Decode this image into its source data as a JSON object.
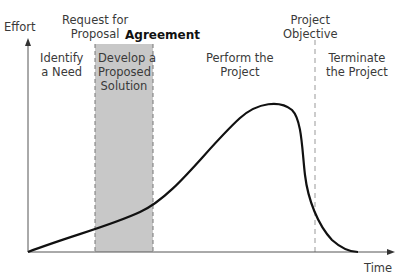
{
  "diagram": {
    "axes": {
      "y_label": "Effort",
      "x_label": "Time"
    },
    "milestones": {
      "request_for_proposal": "Request for Proposal",
      "request_line1": "Request for",
      "request_line2": "Proposal",
      "agreement": "Agreement",
      "objective_line1": "Project",
      "objective_line2": "Objective"
    },
    "phases": [
      {
        "line1": "Identify",
        "line2": "a Need",
        "line3": ""
      },
      {
        "line1": "Develop a",
        "line2": "Proposed",
        "line3": "Solution",
        "shaded": true
      },
      {
        "line1": "Perform the",
        "line2": "Project",
        "line3": ""
      },
      {
        "line1": "Terminate",
        "line2": "the Project",
        "line3": ""
      }
    ],
    "colors": {
      "shade": "#c8c8c8",
      "curve": "#111111",
      "axis": "#444444",
      "dash": "#888888"
    }
  }
}
